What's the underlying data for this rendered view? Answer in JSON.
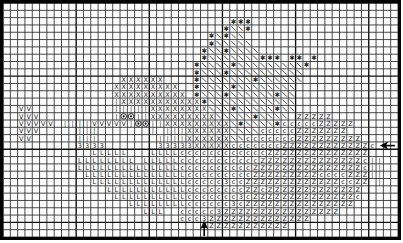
{
  "pattern": {
    "title": "Cross-stitch chart",
    "cols": 54,
    "rows": 32,
    "legend_symbols": {
      "X": "X",
      "*": "✱",
      "\\": "╲",
      "V": "V",
      "|": "|",
      "O": "◉",
      "3": "3",
      "L": "L",
      "C": "c",
      "Z": "Z"
    },
    "grid": [
      "......................................................",
      "......................................................",
      "...............................***....................",
      "..............................*\\\\*...................",
      "............................*\\*\\\\...................",
      "............................*\\\\\\\\\\..................",
      "...........................*\\\\*\\\\\\\\................",
      "...........................*\\\\\\\\\\\\\\***.**.*.........",
      "..........................*\\\\\\\\*\\\\\\\\\\\\\\\\\\*.......",
      "..........................*\\\\\\*\\\\\\\\\\\\\\\\\\\\.......",
      "................XXXXXX....*\\\\\\\\\\\\\\*\\\\\\\\\\\\.........",
      "...............XXXXXXXXX..*\\\\\\\\*\\\\\\\\\\\\\\\\.........",
      "...............XXXXXXXXXX.*\\\\\\*\\\\\\\\\\\\*\\\\.........",
      "...............|XXXXXXXXXXX*\\\\\\\\\\\\\\\\\\\\\\\\.........",
      "..VV...........|||||XXXXXXXX\\\\\\*\\\\\\\\\\*\\\\..........",
      "..VVV..........|OO||XXXXXXXXX\\\\\\\\\\*\\\\\\\\.ZZZZZ...",
      "..VVVVV.||||VVVVV|OO||XXXXXXXXX\\*\\\\\\\\*CCCCCZZZZZ...",
      "..VVV.....|||.......|.|||XXXXXX\\\\\\\\CCCCCZZZZZZZ..",
      "..VV......|||........||||XXXXXX\\\\CCCCCCCZZZZZZZZZ..",
      "..........3333.......33333XXXXXCCCCCCCZZZZZZZZZZZZC.",
      "............LLLLL...LLLLCCCCCCCCCCCCZZZZZZZZZZZZZZ..",
      "..........LLLLLLLL.LLLLLCCCCCCCCCCCZZZZZZZZZZZZZZC||",
      "..........LLLLLLLLLLLLLLCCCCCCCCCCZZZZZZZZZZZZZZZC||",
      "...........LLLLLLLLLLLLLLCCCCCCCCCZZZZZZZZZCCCCZZZ||",
      "............LLLLLLLLLLLLLCCCCC3CCZZZZZZZZZZZZZCCZZ.|",
      "..............LLLLLLLLLLLCCCCCCCCZZCZZZZZZZZZZZZZ...",
      "...............LLLLLLLLLLCCCCCCC3CZZZZZZZZZZZZZZC...",
      ".................LLLLLLLLCCCCCC3CZZZZZZZZZZZZZZZ....",
      "...................LLL..CCCCC3ZZZZZZZZZZZZZZZZ......",
      "........................CCC3ZZZZZZZZZZZZZZ..........",
      "...........................ZZZZZZZZZZZZ.............",
      "......................................................"
    ],
    "markers": [
      {
        "name": "center-row-arrow",
        "direction": "left",
        "row": 19
      },
      {
        "name": "center-col-arrow",
        "direction": "up",
        "col": 27
      }
    ]
  }
}
